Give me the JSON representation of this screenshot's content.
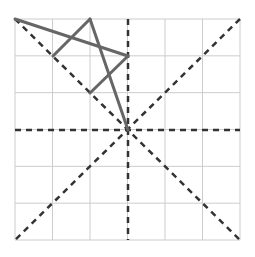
{
  "diagram": {
    "grid": {
      "cols": 6,
      "rows": 6,
      "x0": 15,
      "y0": 19,
      "x1": 240,
      "y1": 240,
      "color": "#cccccc"
    },
    "dashed_lines": [
      {
        "name": "diagonal-main",
        "x1": 15,
        "y1": 19,
        "x2": 240,
        "y2": 240
      },
      {
        "name": "diagonal-anti",
        "x1": 240,
        "y1": 19,
        "x2": 15,
        "y2": 240
      },
      {
        "name": "vertical-center",
        "x1": 128,
        "y1": 19,
        "x2": 128,
        "y2": 240
      },
      {
        "name": "horizontal-center",
        "x1": 15,
        "y1": 130,
        "x2": 240,
        "y2": 130
      }
    ],
    "solid_lines": [
      {
        "name": "segment-top-left-to-right",
        "x1": 15,
        "y1": 19,
        "x2": 128,
        "y2": 56
      },
      {
        "name": "segment-right-to-inner",
        "x1": 128,
        "y1": 56,
        "x2": 90,
        "y2": 93
      },
      {
        "name": "segment-left-to-apex",
        "x1": 53,
        "y1": 56,
        "x2": 90,
        "y2": 19
      },
      {
        "name": "segment-apex-to-center",
        "x1": 90,
        "y1": 19,
        "x2": 128,
        "y2": 130
      }
    ],
    "dashed_color": "#333333",
    "solid_color": "#666666"
  }
}
